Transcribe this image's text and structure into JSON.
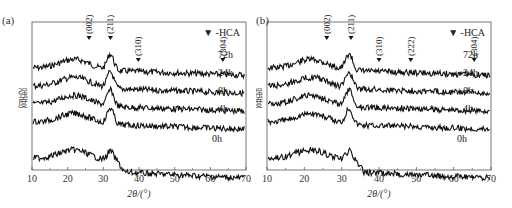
{
  "chart_data": [
    {
      "type": "line",
      "panel_label": "(a)",
      "title": "",
      "xlabel": "2θ/(°)",
      "ylabel": "强度",
      "xlim": [
        10,
        70
      ],
      "xticks": [
        10,
        20,
        30,
        40,
        50,
        60,
        70
      ],
      "legend": "▼ -HCA",
      "peak_markers": [
        {
          "label": "(002)",
          "x": 26
        },
        {
          "label": "(211)",
          "x": 32
        },
        {
          "label": "(310)",
          "x": 39.8
        },
        {
          "label": "(304)",
          "x": 63.5
        }
      ],
      "series": [
        {
          "name": "72h",
          "offset": 4
        },
        {
          "name": "24h",
          "offset": 3
        },
        {
          "name": "8h",
          "offset": 2
        },
        {
          "name": "4h",
          "offset": 1
        },
        {
          "name": "0h",
          "offset": 0
        }
      ],
      "grid": false
    },
    {
      "type": "line",
      "panel_label": "(b)",
      "title": "",
      "xlabel": "2θ/(°)",
      "ylabel": "强度",
      "xlim": [
        10,
        70
      ],
      "xticks": [
        10,
        20,
        30,
        40,
        50,
        60,
        70
      ],
      "legend": "▼ -HCA",
      "peak_markers": [
        {
          "label": "(002)",
          "x": 26
        },
        {
          "label": "(211)",
          "x": 32.5
        },
        {
          "label": "(310)",
          "x": 40
        },
        {
          "label": "(222)",
          "x": 48.5
        },
        {
          "label": "(304)",
          "x": 65.5
        }
      ],
      "series": [
        {
          "name": "72h",
          "offset": 4
        },
        {
          "name": "24h",
          "offset": 3
        },
        {
          "name": "8h",
          "offset": 2
        },
        {
          "name": "4h",
          "offset": 1
        },
        {
          "name": "0h",
          "offset": 0
        }
      ],
      "grid": false
    }
  ]
}
